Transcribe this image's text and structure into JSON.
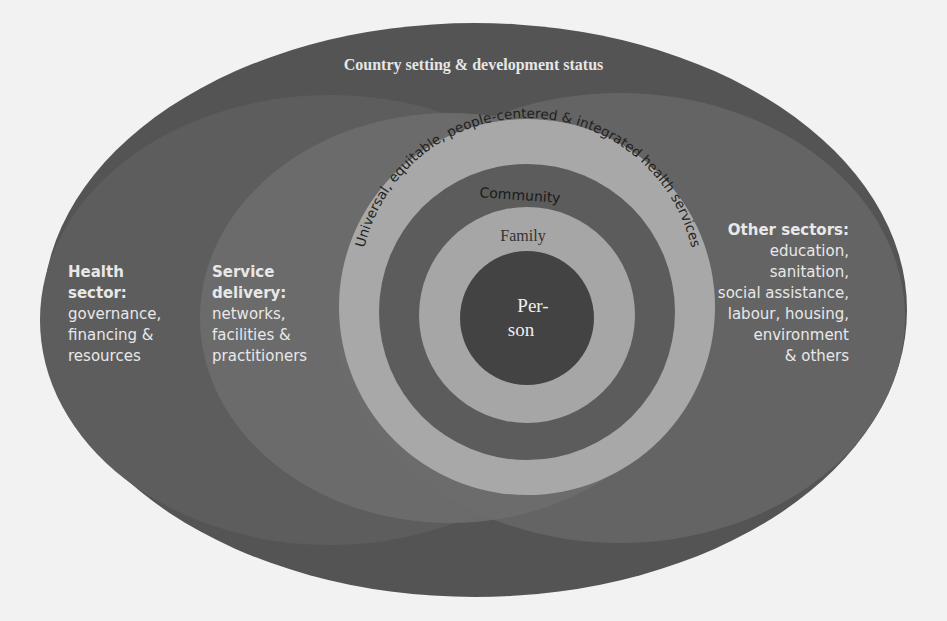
{
  "diagram": {
    "title": "Country setting & development status",
    "health_sector": {
      "heading1": "Health",
      "heading2": "sector:",
      "lines": [
        "governance,",
        "financing &",
        "resources"
      ]
    },
    "service_delivery": {
      "heading1": "Service",
      "heading2": "delivery:",
      "lines": [
        "networks,",
        "facilities &",
        "practitioners"
      ]
    },
    "other_sectors": {
      "heading": "Other sectors:",
      "lines": [
        "education,",
        "sanitation,",
        "social assistance,",
        "labour, housing,",
        "environment",
        "& others"
      ]
    },
    "rings": {
      "outer_arc_text": "Universal, equitable, people-centered & integrated health services",
      "community": "Community",
      "family": "Family",
      "person_line1": "Per-",
      "person_line2": "son"
    },
    "colors": {
      "background": "#f2f2f2",
      "country_ellipse": "#555555",
      "health_ellipse": "#5f5f5f",
      "service_ellipse": "#6e6e6e",
      "other_ellipse": "#666666",
      "ring_light": "#a9a9a9",
      "ring_dark": "#5a5a5a",
      "person_core": "#444444"
    }
  }
}
